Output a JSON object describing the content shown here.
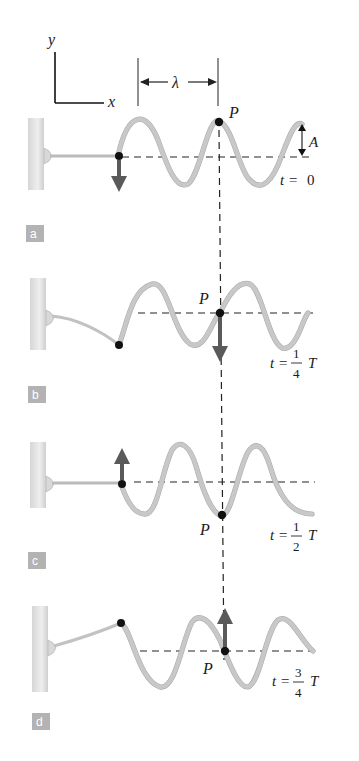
{
  "axes": {
    "y_label": "y",
    "x_label": "x"
  },
  "wavelength_label": "λ",
  "amplitude_label": "A",
  "point_label": "P",
  "colors": {
    "string": "#c8c8c8",
    "arrow": "#5a5a5a",
    "panel_badge": "#b3b3b3",
    "wall": "#e2e2e2"
  },
  "panels": [
    {
      "badge": "a",
      "time_prefix": "t = ",
      "time_value": "0",
      "numerator": "",
      "denominator": "",
      "time_suffix": "",
      "end_arrow": "down",
      "p_arrow": "none"
    },
    {
      "badge": "b",
      "time_prefix": "t = ",
      "numerator": "1",
      "denominator": "4",
      "time_suffix": "T",
      "end_arrow": "none",
      "p_arrow": "down"
    },
    {
      "badge": "c",
      "time_prefix": "t = ",
      "numerator": "1",
      "denominator": "2",
      "time_suffix": "T",
      "end_arrow": "up",
      "p_arrow": "none"
    },
    {
      "badge": "d",
      "time_prefix": "t = ",
      "numerator": "3",
      "denominator": "4",
      "time_suffix": "T",
      "end_arrow": "none",
      "p_arrow": "up"
    }
  ]
}
